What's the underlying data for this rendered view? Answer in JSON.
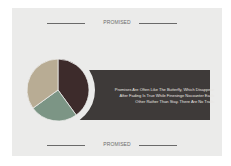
{
  "header": {
    "label": "PROMISED"
  },
  "footer": {
    "label": "PROMISED"
  },
  "quote_box": {
    "text": "Promises Are Often Like The Butterfly, Which Disappear After Fading Is True While Finesinge Nocounter Each Other Rather Than Stay. There Are No Trails",
    "color": "#3e3a39"
  },
  "chart_data": {
    "type": "pie",
    "title": "",
    "slices": [
      {
        "label": "",
        "value": 40,
        "color": "#3d2b2b"
      },
      {
        "label": "",
        "value": 25,
        "color": "#7c9585"
      },
      {
        "label": "",
        "value": 35,
        "color": "#b8ac94"
      }
    ],
    "start_angle": "12 o'clock",
    "direction": "clockwise",
    "legend": "none"
  }
}
